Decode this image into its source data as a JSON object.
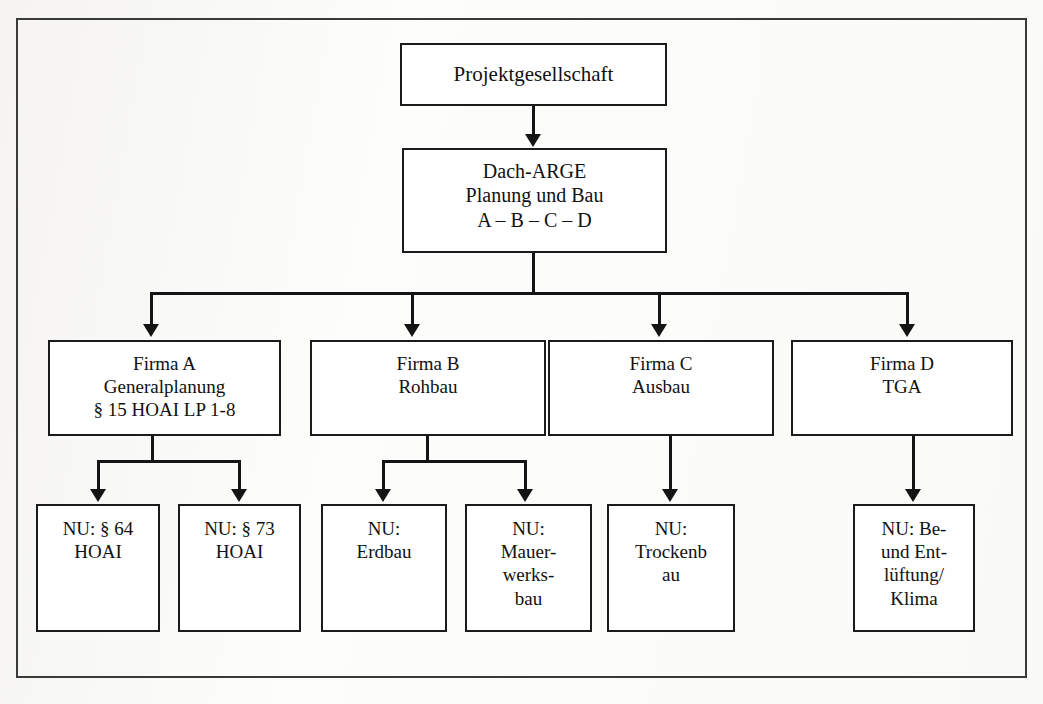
{
  "diagram": {
    "type": "organizational-chart",
    "frame_color": "#3a3a3a",
    "box_border_color": "#1b1b1b",
    "connector_color": "#141414",
    "background_color": "#fdfdfc"
  },
  "nodes": {
    "root": {
      "id": "projektgesellschaft",
      "lines": [
        "Projektgesellschaft"
      ],
      "level": 1
    },
    "dacharge": {
      "id": "dach-arge",
      "lines": [
        "Dach-ARGE",
        "Planung und Bau",
        "A – B – C – D"
      ],
      "level": 2
    },
    "firmen": [
      {
        "id": "firma-a",
        "lines": [
          "Firma A",
          "Generalplanung",
          "§ 15 HOAI LP 1-8"
        ],
        "level": 3
      },
      {
        "id": "firma-b",
        "lines": [
          "Firma B",
          "Rohbau"
        ],
        "level": 3
      },
      {
        "id": "firma-c",
        "lines": [
          "Firma C",
          "Ausbau"
        ],
        "level": 3
      },
      {
        "id": "firma-d",
        "lines": [
          "Firma D",
          "TGA"
        ],
        "level": 3
      }
    ],
    "nachunternehmer": [
      {
        "id": "nu-hoai-64",
        "lines": [
          "NU: § 64",
          "HOAI"
        ],
        "parent": "firma-a",
        "level": 4
      },
      {
        "id": "nu-hoai-73",
        "lines": [
          "NU: § 73",
          "HOAI"
        ],
        "parent": "firma-a",
        "level": 4
      },
      {
        "id": "nu-erdbau",
        "lines": [
          "NU:",
          "Erdbau"
        ],
        "parent": "firma-b",
        "level": 4
      },
      {
        "id": "nu-mauerwerksbau",
        "lines": [
          "NU:",
          "Mauer-",
          "werks-",
          "bau"
        ],
        "parent": "firma-b",
        "level": 4
      },
      {
        "id": "nu-trockenbau",
        "lines": [
          "NU:",
          "Trockenb",
          "au"
        ],
        "parent": "firma-c",
        "level": 4
      },
      {
        "id": "nu-lueftung",
        "lines": [
          "NU: Be-",
          "und Ent-",
          "lüftung/",
          "Klima"
        ],
        "parent": "firma-d",
        "level": 4
      }
    ]
  }
}
